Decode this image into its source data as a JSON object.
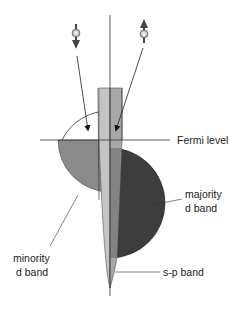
{
  "diagram": {
    "labels": {
      "fermi_level": "Fermi level",
      "majority_line1": "majority",
      "majority_line2": "d band",
      "minority_line1": "minority",
      "minority_line2": "d band",
      "sp_band": "s-p band"
    },
    "spins": [
      {
        "name": "spin-down electron",
        "direction": "down"
      },
      {
        "name": "spin-up electron",
        "direction": "up"
      }
    ],
    "colors": {
      "minority_fill": "#8a8a8a",
      "majority_fill": "#3d3d3d",
      "sp_fill": "#b8b8b8",
      "line": "#333333"
    }
  }
}
